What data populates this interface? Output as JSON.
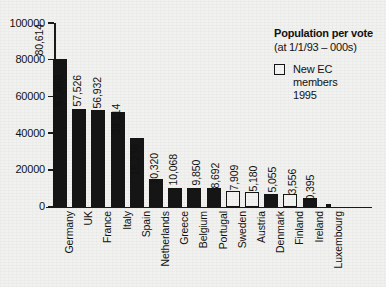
{
  "chart_data": {
    "type": "bar",
    "title": "Population per vote",
    "subtitle": "(at 1/1/93 – 000s)",
    "xlabel": "",
    "ylabel": "",
    "ylim": [
      0,
      100000
    ],
    "yticks": [
      0,
      20000,
      40000,
      60000,
      80000,
      100000
    ],
    "ytick_labels": [
      "0",
      "20000",
      "40000",
      "60000",
      "80000",
      "100000"
    ],
    "grid": false,
    "legend_position": "top-right",
    "categories": [
      "Germany",
      "UK",
      "France",
      "Italy",
      "Spain",
      "Netherlands",
      "Greece",
      "Belgium",
      "Portugal",
      "Sweden",
      "Austria",
      "Denmark",
      "Finland",
      "Ireland",
      "Luxembourg"
    ],
    "values": [
      80614,
      57959,
      57526,
      56932,
      39114,
      15238,
      10320,
      10068,
      9850,
      8692,
      7909,
      5180,
      5055,
      3556,
      395
    ],
    "value_labels": [
      "80,614",
      "57,959",
      "57,526",
      "56,932",
      "39,114",
      "15,238",
      "10,320",
      "10,068",
      "9,850",
      "8,692",
      "7,909",
      "5,180",
      "5,055",
      "3,556",
      "0,395"
    ],
    "bar_plot_values": [
      80614,
      53100,
      52600,
      51700,
      37500,
      15238,
      10320,
      10068,
      9850,
      8692,
      7909,
      6600,
      6700,
      4700,
      1500
    ],
    "bar_styles": [
      "filled",
      "filled",
      "filled",
      "filled",
      "filled",
      "filled",
      "filled",
      "filled",
      "filled",
      "hollow",
      "hollow",
      "filled",
      "hollow",
      "filled",
      "filled"
    ],
    "series": [
      {
        "name": "Existing EC members",
        "style": "filled"
      },
      {
        "name": "New EC members 1995",
        "style": "hollow"
      }
    ]
  },
  "legend": {
    "title": "Population per vote",
    "subtitle": "(at 1/1/93 – 000s)",
    "entry_lines": [
      "New EC",
      "members",
      "1995"
    ]
  },
  "colors": {
    "background": "#f1f1ef",
    "bar_filled": "#151515",
    "bar_hollow_fill": "#f4f4f2",
    "axis": "#1a1a1a",
    "text": "#111111"
  }
}
